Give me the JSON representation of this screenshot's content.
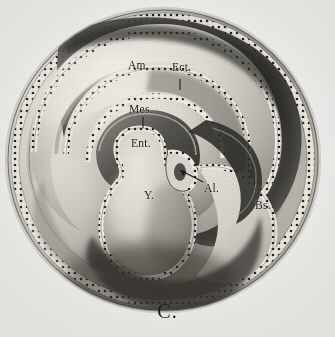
{
  "figure": {
    "caption": "C.",
    "type": "anatomical-illustration",
    "medium": "halftone engraving",
    "palette": {
      "paper": "#f3f3f1",
      "ink_dark": "#2b2a27",
      "shadow": "#4a4844",
      "midtone": "#9b9892",
      "highlight": "#eceae3",
      "membrane_fill": "#dcd9d0",
      "label_ink": "#1b1b1b"
    },
    "labels": [
      {
        "id": "am",
        "text": "Am.",
        "name": "amnion",
        "x": 128,
        "y": 60,
        "leader": "none"
      },
      {
        "id": "ect",
        "text": "Ect.",
        "name": "ectoderm",
        "x": 172,
        "y": 62,
        "leader": "tick-down"
      },
      {
        "id": "mes",
        "text": "Mes.",
        "name": "mesoderm",
        "x": 129,
        "y": 104,
        "leader": "tick-down"
      },
      {
        "id": "ent",
        "text": "Ent.",
        "name": "entoderm",
        "x": 131,
        "y": 138,
        "leader": "none"
      },
      {
        "id": "y",
        "text": "Y.",
        "name": "yolk-sac",
        "x": 144,
        "y": 190,
        "leader": "none"
      },
      {
        "id": "al",
        "text": "Al.",
        "name": "allantois",
        "x": 204,
        "y": 183,
        "leader": "arrow-up-left"
      },
      {
        "id": "bs",
        "text": "Bs.",
        "name": "body-stalk",
        "x": 255,
        "y": 200,
        "leader": "none"
      }
    ],
    "structures": [
      {
        "id": "chorion",
        "label": "outer chorionic vesicle"
      },
      {
        "id": "amnion",
        "label": "amniotic fold"
      },
      {
        "id": "ectoderm",
        "label": "ectodermal layer"
      },
      {
        "id": "mesoderm",
        "label": "mesodermal layer"
      },
      {
        "id": "entoderm",
        "label": "entodermal layer"
      },
      {
        "id": "yolk-sac",
        "label": "yolk sac"
      },
      {
        "id": "allantois",
        "label": "allantoic stalk"
      },
      {
        "id": "body-stalk",
        "label": "body stalk"
      }
    ]
  }
}
